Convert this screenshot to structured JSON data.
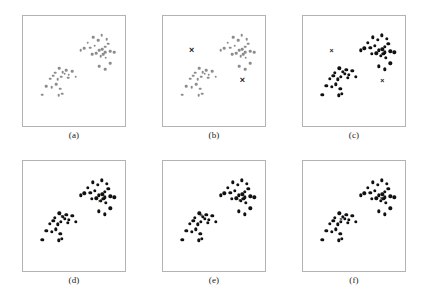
{
  "figure": {
    "title": "",
    "background_color": "#ffffff",
    "frame_color": "#b3b3b3",
    "point_color_gray": "#8c8c8c",
    "point_color_black": "#111111",
    "marker_color": "#1a1a1a"
  },
  "chart_data": {
    "type": "scatter",
    "title": "",
    "xlabel": "",
    "ylabel": "",
    "xlim": [
      0,
      100
    ],
    "ylim": [
      0,
      100
    ],
    "grid": false,
    "legend": "none",
    "panel_count": 6,
    "shared_points": {
      "name": "data points",
      "count": 44,
      "x": [
        66,
        72,
        78,
        82,
        86,
        88,
        90,
        58,
        62,
        69,
        74,
        79,
        83,
        86,
        92,
        71,
        76,
        81,
        84,
        87,
        97,
        79,
        86,
        92,
        28,
        33,
        37,
        41,
        44,
        48,
        22,
        26,
        31,
        35,
        39,
        43,
        52,
        18,
        24,
        29,
        34,
        13,
        32,
        36
      ],
      "y": [
        80,
        86,
        83,
        88,
        76,
        84,
        79,
        72,
        74,
        75,
        77,
        72,
        73,
        70,
        71,
        68,
        69,
        66,
        68,
        64,
        70,
        55,
        52,
        58,
        48,
        53,
        49,
        51,
        46,
        50,
        42,
        45,
        41,
        44,
        47,
        43,
        44,
        34,
        33,
        36,
        31,
        25,
        24,
        26
      ]
    },
    "panels": [
      {
        "id": "a",
        "label": "(a)",
        "description": "raw unlabeled data points, light gray",
        "point_style": "gray",
        "markers": []
      },
      {
        "id": "b",
        "label": "(b)",
        "description": "initial random cluster centroids placed as X markers",
        "point_style": "gray",
        "markers": [
          {
            "x": 24,
            "y": 72,
            "style": "big"
          },
          {
            "x": 83,
            "y": 40,
            "style": "big"
          }
        ]
      },
      {
        "id": "c",
        "label": "(c)",
        "description": "points assigned to nearest centroid, centroids still at initial position",
        "point_style": "black",
        "markers": [
          {
            "x": 24,
            "y": 72,
            "style": "mid"
          },
          {
            "x": 83,
            "y": 40,
            "style": "mid"
          }
        ]
      },
      {
        "id": "d",
        "label": "(d)",
        "description": "centroids moved to cluster means, iteration 1",
        "point_style": "black",
        "markers": [
          {
            "x": 36,
            "y": 50,
            "style": "small"
          },
          {
            "x": 80,
            "y": 66,
            "style": "small"
          }
        ]
      },
      {
        "id": "e",
        "label": "(e)",
        "description": "centroids updated, iteration 2",
        "point_style": "black",
        "markers": [
          {
            "x": 35,
            "y": 51,
            "style": "small"
          },
          {
            "x": 80,
            "y": 67,
            "style": "small"
          }
        ]
      },
      {
        "id": "f",
        "label": "(f)",
        "description": "converged centroids, final clustering",
        "point_style": "black",
        "markers": [
          {
            "x": 35,
            "y": 47,
            "style": "small"
          },
          {
            "x": 82,
            "y": 69,
            "style": "small"
          }
        ]
      }
    ]
  },
  "layout": {
    "panels": [
      {
        "id": "a",
        "left": 22,
        "top": 15,
        "width": 104,
        "height": 112,
        "caption_top": 130
      },
      {
        "id": "b",
        "left": 162,
        "top": 15,
        "width": 104,
        "height": 112,
        "caption_top": 130
      },
      {
        "id": "c",
        "left": 302,
        "top": 15,
        "width": 104,
        "height": 112,
        "caption_top": 130
      },
      {
        "id": "d",
        "left": 22,
        "top": 160,
        "width": 104,
        "height": 112,
        "caption_top": 275
      },
      {
        "id": "e",
        "left": 162,
        "top": 160,
        "width": 104,
        "height": 112,
        "caption_top": 275
      },
      {
        "id": "f",
        "left": 302,
        "top": 160,
        "width": 104,
        "height": 112,
        "caption_top": 275
      }
    ]
  }
}
